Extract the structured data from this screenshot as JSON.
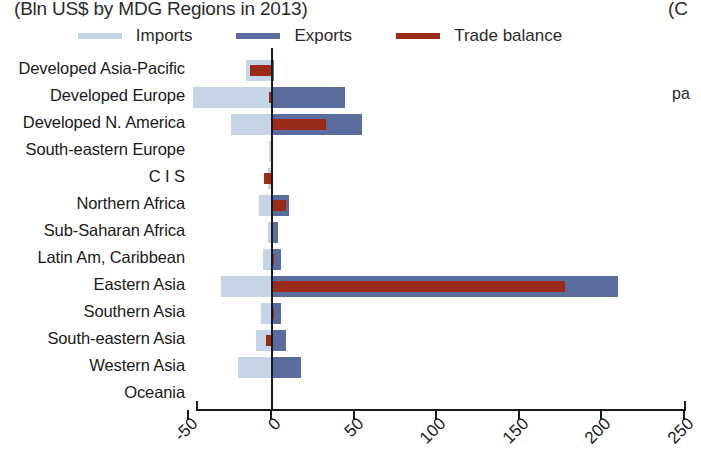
{
  "title": {
    "subtitle": "(Bln US$ by MDG Regions in 2013)",
    "right_clipped_top": "(C",
    "right_clipped_mid": "pa"
  },
  "legend": {
    "position": "top-center",
    "entries": [
      {
        "label": "Imports",
        "color": "#c6d4e8",
        "swatch": "line-swatch"
      },
      {
        "label": "Exports",
        "color": "#5b6c9e",
        "swatch": "line-swatch"
      },
      {
        "label": "Trade balance",
        "color": "#9c2a18",
        "swatch": "line-swatch"
      }
    ]
  },
  "axis": {
    "ticks": [
      "-50",
      "0",
      "50",
      "100",
      "150",
      "200",
      "250"
    ],
    "tick_values": [
      -50,
      0,
      50,
      100,
      150,
      200,
      250
    ],
    "xmin": -50,
    "xmax": 250,
    "grid": false
  },
  "chart_data": {
    "type": "bar",
    "orientation": "horizontal",
    "title": "(Bln US$ by MDG Regions in 2013)",
    "xlabel": "",
    "ylabel": "",
    "xlim": [
      -50,
      250
    ],
    "grid": false,
    "legend_position": "top-center",
    "categories": [
      "Developed Asia-Pacific",
      "Developed Europe",
      "Developed N. America",
      "South-eastern Europe",
      "C I S",
      "Northern Africa",
      "Sub-Saharan Africa",
      "Latin Am, Caribbean",
      "Eastern Asia",
      "Southern Asia",
      "South-eastern Asia",
      "Western Asia",
      "Oceania"
    ],
    "series": [
      {
        "name": "Imports",
        "color": "#c6d4e8",
        "values": [
          -15,
          -47,
          -24,
          -1,
          -2,
          -7,
          -2,
          -5,
          -30,
          -6,
          -9,
          -20,
          0
        ]
      },
      {
        "name": "Exports",
        "color": "#5b6c9e",
        "values": [
          2,
          45,
          55,
          1,
          1,
          11,
          4,
          6,
          210,
          6,
          9,
          18,
          0
        ]
      },
      {
        "name": "Trade balance",
        "color": "#9c2a18",
        "values": [
          -13,
          -1,
          33,
          0,
          -4,
          9,
          0,
          2,
          178,
          2,
          -3,
          0,
          0
        ]
      }
    ]
  }
}
